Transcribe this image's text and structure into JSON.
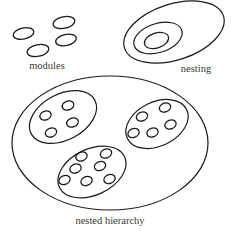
{
  "figure": {
    "background_color": "#ffffff",
    "stroke_color": "#1a1a1a",
    "text_color": "#3a3a3a"
  },
  "captions": {
    "modules": "modules",
    "nesting": "nesting",
    "nested_hierarchy": "nested hierarchy"
  },
  "groups": {
    "modules": {
      "label": "modules",
      "label_x": 47,
      "label_y": 69,
      "count": 4,
      "ellipses": [
        {
          "cx": 23.5,
          "cy": 33.5,
          "rx": 10.5,
          "ry": 5.5,
          "rot": -12
        },
        {
          "cx": 64.0,
          "cy": 22.5,
          "rx": 11.0,
          "ry": 5.8,
          "rot": -12
        },
        {
          "cx": 66.0,
          "cy": 40.0,
          "rx": 10.5,
          "ry": 5.5,
          "rot": -12
        },
        {
          "cx": 38.0,
          "cy": 50.5,
          "rx": 11.0,
          "ry": 5.8,
          "rot": -12
        }
      ]
    },
    "nesting": {
      "label": "nesting",
      "label_x": 196,
      "label_y": 72,
      "count": 3,
      "ellipses": [
        {
          "cx": 174.0,
          "cy": 32.0,
          "rx": 52.0,
          "ry": 28.0,
          "rot": -18
        },
        {
          "cx": 158.0,
          "cy": 38.0,
          "rx": 25.0,
          "ry": 14.5,
          "rot": -18
        },
        {
          "cx": 156.5,
          "cy": 40.5,
          "rx": 12.5,
          "ry": 7.5,
          "rot": -18
        }
      ]
    },
    "nested_hierarchy": {
      "label": "nested hierarchy",
      "label_x": 110,
      "label_y": 224,
      "outer": {
        "cx": 110.0,
        "cy": 143.0,
        "rx": 98.0,
        "ry": 67.0,
        "rot": 0
      },
      "clusters": [
        {
          "name": "cluster-top-left",
          "ellipse": {
            "cx": 63.0,
            "cy": 117.0,
            "rx": 36.0,
            "ry": 23.0,
            "rot": -28
          },
          "dot_count": 4,
          "dots": [
            {
              "cx": 45.5,
              "cy": 115.5,
              "rx": 5.8,
              "ry": 4.4,
              "rot": -20
            },
            {
              "cx": 68.0,
              "cy": 105.5,
              "rx": 6.0,
              "ry": 4.5,
              "rot": -20
            },
            {
              "cx": 51.0,
              "cy": 132.5,
              "rx": 5.8,
              "ry": 4.4,
              "rot": -20
            },
            {
              "cx": 72.5,
              "cy": 122.5,
              "rx": 6.0,
              "ry": 4.5,
              "rot": -20
            }
          ]
        },
        {
          "name": "cluster-top-right",
          "ellipse": {
            "cx": 157.0,
            "cy": 124.0,
            "rx": 33.0,
            "ry": 22.0,
            "rot": -26
          },
          "dot_count": 5,
          "dots": [
            {
              "cx": 142.0,
              "cy": 116.5,
              "rx": 5.8,
              "ry": 4.4,
              "rot": -20
            },
            {
              "cx": 165.0,
              "cy": 107.5,
              "rx": 5.8,
              "ry": 4.4,
              "rot": -20
            },
            {
              "cx": 170.5,
              "cy": 124.5,
              "rx": 5.8,
              "ry": 4.4,
              "rot": -20
            },
            {
              "cx": 133.5,
              "cy": 133.0,
              "rx": 5.8,
              "ry": 4.4,
              "rot": -20
            },
            {
              "cx": 152.5,
              "cy": 132.5,
              "rx": 5.8,
              "ry": 4.4,
              "rot": -20
            }
          ]
        },
        {
          "name": "cluster-bottom",
          "ellipse": {
            "cx": 92.0,
            "cy": 172.0,
            "rx": 36.0,
            "ry": 23.0,
            "rot": -25
          },
          "dot_count": 7,
          "dots": [
            {
              "cx": 81.5,
              "cy": 156.5,
              "rx": 5.8,
              "ry": 4.4,
              "rot": -20
            },
            {
              "cx": 106.0,
              "cy": 153.5,
              "rx": 5.8,
              "ry": 4.4,
              "rot": -20
            },
            {
              "cx": 75.5,
              "cy": 168.5,
              "rx": 5.8,
              "ry": 4.4,
              "rot": -20
            },
            {
              "cx": 100.0,
              "cy": 166.0,
              "rx": 5.8,
              "ry": 4.4,
              "rot": -20
            },
            {
              "cx": 64.5,
              "cy": 180.0,
              "rx": 5.8,
              "ry": 4.4,
              "rot": -20
            },
            {
              "cx": 86.5,
              "cy": 181.0,
              "rx": 5.8,
              "ry": 4.4,
              "rot": -20
            },
            {
              "cx": 109.5,
              "cy": 179.0,
              "rx": 5.8,
              "ry": 4.4,
              "rot": -20
            }
          ]
        }
      ]
    }
  }
}
